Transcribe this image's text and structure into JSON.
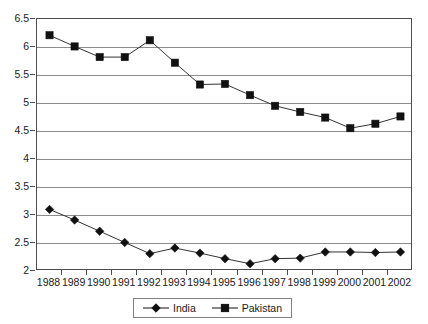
{
  "chart_data": {
    "type": "line",
    "title": "",
    "subtitle": "",
    "xlabel": "",
    "ylabel": "",
    "categories": [
      "1988",
      "1989",
      "1990",
      "1991",
      "1992",
      "1993",
      "1994",
      "1995",
      "1996",
      "1997",
      "1998",
      "1999",
      "2000",
      "2001",
      "2002"
    ],
    "series": [
      {
        "name": "India",
        "marker": "diamond",
        "color": "#111111",
        "values": [
          3.1,
          2.91,
          2.71,
          2.51,
          2.31,
          2.41,
          2.32,
          2.22,
          2.13,
          2.22,
          2.23,
          2.34,
          2.34,
          2.33,
          2.34
        ]
      },
      {
        "name": "Pakistan",
        "marker": "square",
        "color": "#111111",
        "values": [
          6.21,
          6.01,
          5.82,
          5.82,
          6.12,
          5.72,
          5.33,
          5.34,
          5.14,
          4.95,
          4.84,
          4.74,
          4.55,
          4.63,
          4.76
        ]
      }
    ],
    "ylim": [
      2,
      6.5
    ],
    "yticks": [
      2,
      2.5,
      3,
      3.5,
      4,
      4.5,
      5,
      5.5,
      6,
      6.5
    ],
    "ytick_labels": [
      "2",
      "2.5",
      "3",
      "3.5",
      "4",
      "4.5",
      "5",
      "5.5",
      "6",
      "6.5"
    ],
    "grid": true,
    "grid_axis": "y",
    "legend_position": "bottom-center",
    "legend_entries": [
      "India",
      "Pakistan"
    ]
  }
}
